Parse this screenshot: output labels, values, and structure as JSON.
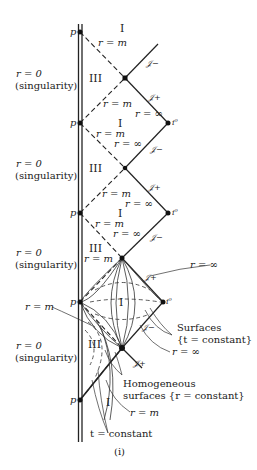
{
  "figure": {
    "caption": "(i)",
    "region_labels": {
      "region_I": "I",
      "region_III": "III"
    },
    "point_labels": {
      "p": "p",
      "i0": "i⁰",
      "scri_plus": "𝒥+",
      "scri_minus": "𝒥−"
    },
    "radius_labels": {
      "r_m": "r = m",
      "r_inf": "r = ∞",
      "r_0": "r = 0",
      "singularity": "(singularity)"
    },
    "annotations": {
      "surfaces_line1": "Surfaces",
      "surfaces_line2": "{t = constant}",
      "homog_line1": "Homogeneous",
      "homog_line2": "surfaces {r = constant}",
      "t_const": "t = constant"
    }
  }
}
